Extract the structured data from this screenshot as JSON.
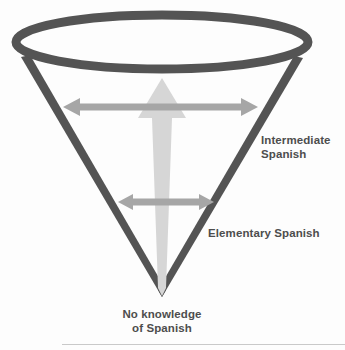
{
  "diagram": {
    "type": "inverted-cone-progression",
    "background_color": "#fdfdfd",
    "cone": {
      "outline_color": "#545454",
      "stroke_width": 9,
      "top_ellipse": {
        "cx": 162,
        "cy": 42,
        "rx": 150,
        "ry": 31
      },
      "apex": {
        "x": 162,
        "y": 297
      },
      "left_rim": {
        "x": 21,
        "y": 57
      },
      "right_rim": {
        "x": 303,
        "y": 58
      }
    },
    "vertical_arrow": {
      "name": "growth-arrow",
      "color": "#d6d6d6",
      "direction": "up",
      "tip_y": 78,
      "tail_y": 288,
      "head_half_width": 24,
      "shaft_top_half_width": 10,
      "shaft_bottom_half_width": 2
    },
    "horizontal_arrows": [
      {
        "name": "intermediate-span-arrow",
        "color": "#a6a6a6",
        "y": 107,
        "x_start": 63,
        "x_end": 258,
        "double_headed": true,
        "measures": "Intermediate Spanish"
      },
      {
        "name": "elementary-span-arrow",
        "color": "#a6a6a6",
        "y": 202,
        "x_start": 118,
        "x_end": 214,
        "double_headed": true,
        "measures": "Elementary Spanish"
      }
    ],
    "labels": {
      "intermediate": "Intermediate\nSpanish",
      "elementary": "Elementary Spanish",
      "base": "No knowledge\nof Spanish",
      "text_color": "#4d4d4d"
    },
    "bottom_rule_color": "#c9c9c9"
  }
}
